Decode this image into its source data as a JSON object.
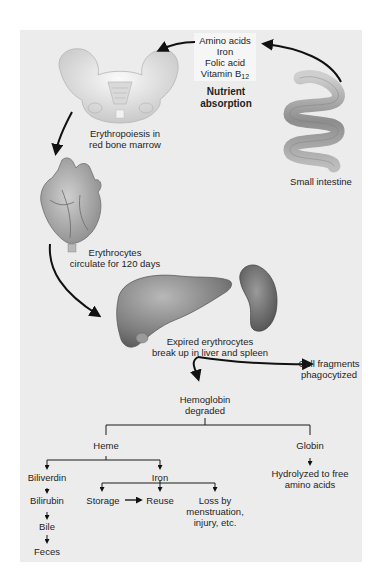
{
  "diagram": {
    "nutrients": {
      "items": [
        "Amino acids",
        "Iron",
        "Folic acid",
        "Vitamin B"
      ],
      "vitamin_subscript": "12",
      "caption_line1": "Nutrient",
      "caption_line2": "absorption"
    },
    "organs": {
      "small_intestine": "Small intestine",
      "bone_marrow_line1": "Erythropoiesis in",
      "bone_marrow_line2": "red bone marrow",
      "circulation_line1": "Erythrocytes",
      "circulation_line2": "circulate for 120 days",
      "liver_spleen_line1": "Expired erythrocytes",
      "liver_spleen_line2": "break up in liver and spleen",
      "fragments_line1": "Cell fragments",
      "fragments_line2": "phagocytized"
    },
    "tree": {
      "root_line1": "Hemoglobin",
      "root_line2": "degraded",
      "heme": "Heme",
      "globin": "Globin",
      "globin_result_line1": "Hydrolyzed to free",
      "globin_result_line2": "amino acids",
      "biliverdin": "Biliverdin",
      "bilirubin": "Bilirubin",
      "bile": "Bile",
      "feces": "Feces",
      "iron": "Iron",
      "storage": "Storage",
      "reuse": "Reuse",
      "loss_line1": "Loss by",
      "loss_line2": "menstruation,",
      "loss_line3": "injury, etc."
    },
    "colors": {
      "panel": "#ececec",
      "arrow": "#111111",
      "organ_gray": "#8a8a8a"
    }
  }
}
